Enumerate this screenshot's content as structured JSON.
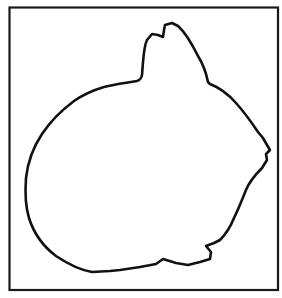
{
  "figure": {
    "subject": "rabbit silhouette outline",
    "colors": {
      "background": "#ffffff",
      "stroke": "#111111",
      "frame": "#1a1a1a"
    },
    "frame_icon": "rectangle-frame",
    "shape_icon": "rabbit-outline"
  }
}
